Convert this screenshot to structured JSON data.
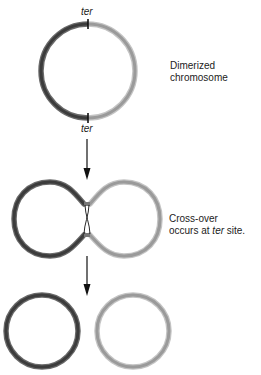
{
  "figure": {
    "steps": [
      {
        "name": "dimerized",
        "caption_line1": "Dimerized",
        "caption_line2": "chromosome",
        "ter_top": "ter",
        "ter_bottom": "ter"
      },
      {
        "name": "crossover",
        "caption_line1": "Cross-over",
        "caption_pre": "occurs at ",
        "caption_italic": "ter",
        "caption_post": " site."
      },
      {
        "name": "resolved"
      }
    ],
    "colors": {
      "dark_strand": "#3c3c3c",
      "dark_strand_edge": "#6a6a6a",
      "light_strand": "#9a9a9a",
      "light_strand_edge": "#c4c4c4",
      "arrow": "#111111",
      "ter_mark": "#111111"
    }
  }
}
